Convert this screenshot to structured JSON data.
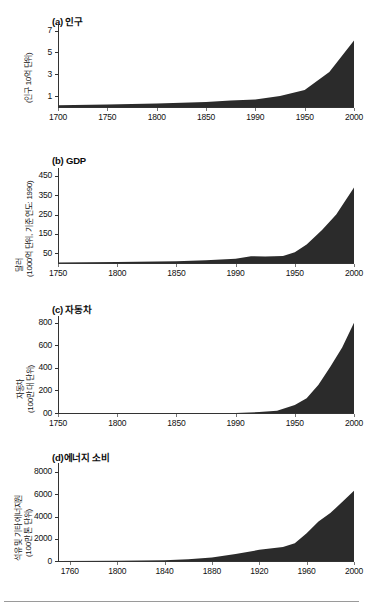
{
  "figure": {
    "background": "#ffffff",
    "area_fill": "#2b2b2b",
    "axis_color": "#333333"
  },
  "panels": [
    {
      "id": "population",
      "title": "(a) 인구",
      "ylabel": "(인구 10억 단위)",
      "ylabel_lines": [
        "(인구 10억 단위)"
      ]
    },
    {
      "id": "gdp",
      "title": "(b) GDP",
      "ylabel": "달러 (1000억 단위, 기준 연도: 1990)",
      "ylabel_lines": [
        "달러",
        "(1000억 단위, 기준 연도: 1990)"
      ]
    },
    {
      "id": "automobiles",
      "title": "(c) 자동차",
      "ylabel": "자동차 (100만 대 단위)",
      "ylabel_lines": [
        "자동차",
        "(100만 대 단위)"
      ]
    },
    {
      "id": "energy",
      "title": "(d)에너지 소비",
      "ylabel": "석유 및 기타 에너지원 (100만 톤 단위)",
      "ylabel_lines": [
        "석유 및 기타 에너지원",
        "(100만 톤 단위)"
      ]
    }
  ],
  "chart_data": [
    {
      "type": "area",
      "id": "population",
      "title": "(a) 인구",
      "xlabel": "",
      "ylabel": "(인구 10억 단위)",
      "xlim": [
        1700,
        2000
      ],
      "ylim": [
        0,
        7.6
      ],
      "yticks": [
        1,
        3,
        5,
        7
      ],
      "ytick_labels": [
        "1",
        "3",
        "5",
        "7"
      ],
      "xticks": [
        1700,
        1750,
        1800,
        1850,
        1900,
        1950,
        2000
      ],
      "xtick_labels": [
        "1700",
        "1750",
        "1800",
        "1850",
        "1990",
        "1950",
        "2000"
      ],
      "grid": false,
      "legend": "none",
      "x": [
        1700,
        1750,
        1800,
        1850,
        1875,
        1900,
        1925,
        1950,
        1975,
        2000
      ],
      "values": [
        0.15,
        0.22,
        0.32,
        0.45,
        0.6,
        0.68,
        1.0,
        1.55,
        3.2,
        6.1
      ]
    },
    {
      "type": "area",
      "id": "gdp",
      "title": "(b) GDP",
      "xlabel": "",
      "ylabel": "달러 (1000억 단위, 기준 연도: 1990)",
      "xlim": [
        1750,
        2000
      ],
      "ylim": [
        0,
        490
      ],
      "yticks": [
        50,
        150,
        250,
        350,
        450
      ],
      "ytick_labels": [
        "50",
        "150",
        "250",
        "350",
        "450"
      ],
      "xticks": [
        1750,
        1800,
        1850,
        1900,
        1950,
        2000
      ],
      "xtick_labels": [
        "1750",
        "1800",
        "1850",
        "1990",
        "1950",
        "2000"
      ],
      "grid": false,
      "legend": "none",
      "x": [
        1750,
        1800,
        1850,
        1875,
        1900,
        1913,
        1925,
        1940,
        1950,
        1960,
        1973,
        1985,
        2000
      ],
      "values": [
        3,
        5,
        9,
        14,
        22,
        35,
        33,
        36,
        55,
        95,
        170,
        250,
        390
      ]
    },
    {
      "type": "area",
      "id": "automobiles",
      "title": "(c) 자동차",
      "xlabel": "",
      "ylabel": "자동차 (100만 대 단위)",
      "xlim": [
        1750,
        2000
      ],
      "ylim": [
        0,
        860
      ],
      "yticks": [
        0,
        200,
        400,
        600,
        800
      ],
      "ytick_labels": [
        "00",
        "200",
        "400",
        "600",
        "800"
      ],
      "xticks": [
        1750,
        1800,
        1850,
        1900,
        1950,
        2000
      ],
      "xtick_labels": [
        "1750",
        "1800",
        "1850",
        "1990",
        "1950",
        "2000"
      ],
      "grid": false,
      "legend": "none",
      "x": [
        1750,
        1850,
        1900,
        1920,
        1935,
        1950,
        1960,
        1970,
        1980,
        1990,
        2000
      ],
      "values": [
        0,
        0,
        1,
        8,
        20,
        70,
        130,
        250,
        410,
        580,
        800
      ]
    },
    {
      "type": "area",
      "id": "energy",
      "title": "(d)에너지 소비",
      "xlabel": "",
      "ylabel": "석유 및 기타 에너지원 (100만 톤 단위)",
      "xlim": [
        1750,
        2000
      ],
      "ylim": [
        0,
        8800
      ],
      "yticks": [
        0,
        2000,
        4000,
        6000,
        8000
      ],
      "ytick_labels": [
        "0",
        "2000",
        "4000",
        "6000",
        "8000"
      ],
      "xticks": [
        1760,
        1800,
        1840,
        1880,
        1920,
        1960,
        2000
      ],
      "xtick_labels": [
        "1760",
        "1800",
        "1840",
        "1880",
        "1920",
        "1960",
        "2000"
      ],
      "grid": false,
      "legend": "none",
      "x": [
        1750,
        1800,
        1840,
        1860,
        1880,
        1900,
        1920,
        1940,
        1950,
        1960,
        1970,
        1980,
        1990,
        2000
      ],
      "values": [
        10,
        30,
        60,
        150,
        320,
        620,
        1000,
        1250,
        1600,
        2500,
        3550,
        4300,
        5300,
        6300
      ]
    }
  ]
}
